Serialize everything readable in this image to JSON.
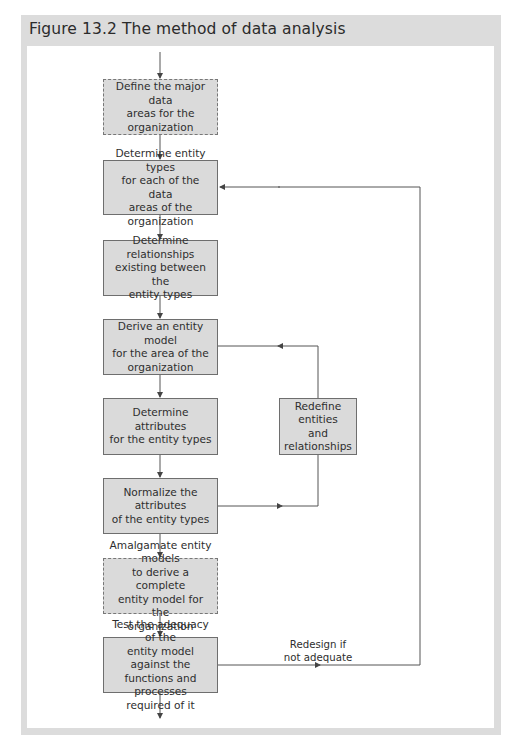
{
  "figure": {
    "title": "Figure 13.2 The method of data analysis"
  },
  "colors": {
    "frame": "#dcdcdc",
    "box_fill": "#dadada",
    "box_border": "#6e6e6e",
    "line": "#555555"
  },
  "flow": {
    "steps": [
      {
        "id": "step-1",
        "text": "Define the major data\nareas for the organization",
        "style": "dashed"
      },
      {
        "id": "step-2",
        "text": "Determine entity types\nfor each of the data\nareas of the organization",
        "style": "solid"
      },
      {
        "id": "step-3",
        "text": "Determine relationships\nexisting between the\nentity types",
        "style": "solid"
      },
      {
        "id": "step-4",
        "text": "Derive an entity model\nfor the area of the\norganization",
        "style": "solid"
      },
      {
        "id": "step-5",
        "text": "Determine attributes\nfor the entity types",
        "style": "solid"
      },
      {
        "id": "step-6",
        "text": "Normalize the attributes\nof the entity types",
        "style": "solid"
      },
      {
        "id": "step-7",
        "text": "Amalgamate entity models\nto derive a complete\nentity model for the\norganization",
        "style": "dashed"
      },
      {
        "id": "step-8",
        "text": "Test the adequacy of the\nentity model against the\nfunctions and processes\nrequired of it",
        "style": "solid"
      }
    ],
    "side_box": {
      "text": "Redefine entities\nand relationships"
    },
    "feedback_label": "Redesign if\nnot adequate"
  }
}
